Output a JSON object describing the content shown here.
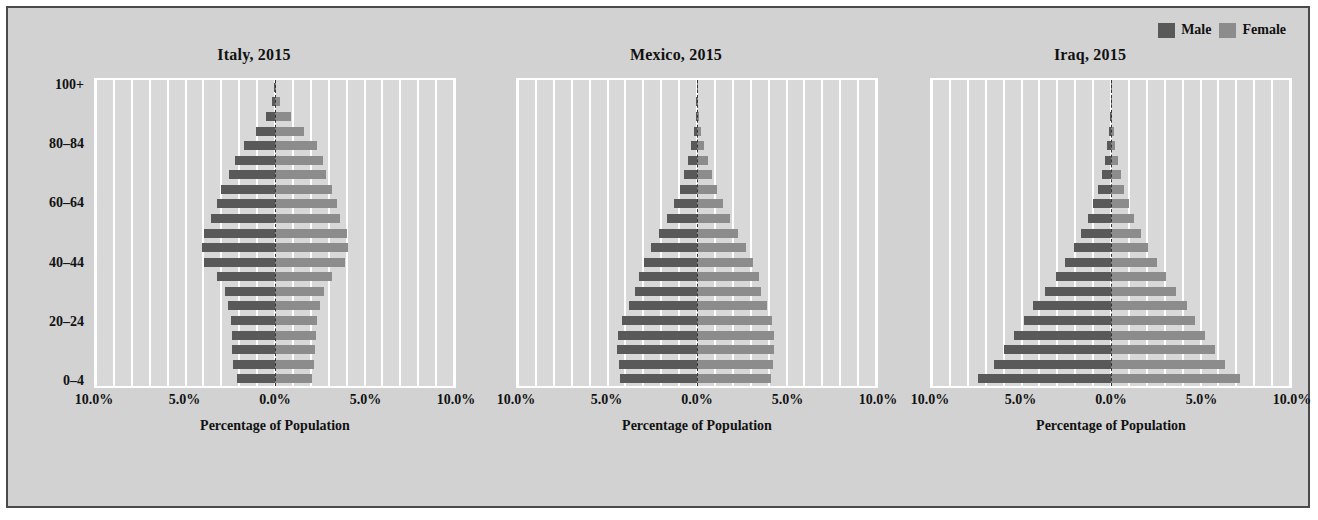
{
  "legend": {
    "items": [
      {
        "label": "Male",
        "color": "#595959"
      },
      {
        "label": "Female",
        "color": "#8c8c8c"
      }
    ]
  },
  "colors": {
    "male": "#595959",
    "female": "#8c8c8c",
    "figure_background": "#d2d2d2",
    "plot_background": "#d8d8d8",
    "gridline": "#ffffff",
    "border": "#4a4a4a",
    "text": "#111111"
  },
  "axis": {
    "xlabel": "Percentage of Population",
    "xticks": [
      "10.0%",
      "5.0%",
      "0.0%",
      "5.0%",
      "10.0%"
    ],
    "xtick_values": [
      -10,
      -5,
      0,
      5,
      10
    ],
    "xlim": [
      -10,
      10
    ],
    "yticks": [
      "100+",
      "80–84",
      "60–64",
      "40–44",
      "20–24",
      "0–4"
    ],
    "ytick_indices": [
      20,
      16,
      12,
      8,
      4,
      0
    ],
    "age_groups": [
      "0–4",
      "5–9",
      "10–14",
      "15–19",
      "20–24",
      "25–29",
      "30–34",
      "35–39",
      "40–44",
      "45–49",
      "50–54",
      "55–59",
      "60–64",
      "65–69",
      "70–74",
      "75–79",
      "80–84",
      "85–89",
      "90–94",
      "95–99",
      "100+"
    ]
  },
  "chart_data": {
    "type": "bar",
    "xlabel": "Percentage of Population",
    "ylabel": "",
    "xlim": [
      -10,
      10
    ],
    "grid": true,
    "legend_position": "top-right",
    "categories": [
      "0–4",
      "5–9",
      "10–14",
      "15–19",
      "20–24",
      "25–29",
      "30–34",
      "35–39",
      "40–44",
      "45–49",
      "50–54",
      "55–59",
      "60–64",
      "65–69",
      "70–74",
      "75–79",
      "80–84",
      "85–89",
      "90–94",
      "95–99",
      "100+"
    ],
    "panels": [
      {
        "title": "Italy, 2015",
        "series": [
          {
            "name": "Male",
            "values": [
              2.15,
              2.35,
              2.4,
              2.4,
              2.45,
              2.6,
              2.8,
              3.25,
              3.95,
              4.1,
              3.95,
              3.55,
              3.25,
              3.0,
              2.55,
              2.25,
              1.75,
              1.05,
              0.5,
              0.15,
              0.03
            ]
          },
          {
            "name": "Female",
            "values": [
              2.05,
              2.2,
              2.25,
              2.3,
              2.35,
              2.5,
              2.75,
              3.2,
              3.9,
              4.1,
              4.0,
              3.65,
              3.45,
              3.2,
              2.85,
              2.7,
              2.35,
              1.6,
              0.9,
              0.3,
              0.07
            ]
          }
        ]
      },
      {
        "title": "Mexico, 2015",
        "series": [
          {
            "name": "Male",
            "values": [
              4.3,
              4.35,
              4.45,
              4.4,
              4.2,
              3.8,
              3.45,
              3.25,
              2.95,
              2.55,
              2.1,
              1.7,
              1.3,
              0.95,
              0.7,
              0.5,
              0.32,
              0.18,
              0.08,
              0.03,
              0.01
            ]
          },
          {
            "name": "Female",
            "values": [
              4.15,
              4.25,
              4.3,
              4.3,
              4.2,
              3.9,
              3.6,
              3.45,
              3.15,
              2.75,
              2.3,
              1.85,
              1.45,
              1.1,
              0.82,
              0.6,
              0.4,
              0.23,
              0.11,
              0.04,
              0.01
            ]
          }
        ]
      },
      {
        "title": "Iraq, 2015",
        "series": [
          {
            "name": "Male",
            "values": [
              7.45,
              6.55,
              6.0,
              5.4,
              4.85,
              4.35,
              3.7,
              3.05,
              2.55,
              2.05,
              1.65,
              1.3,
              1.0,
              0.72,
              0.52,
              0.35,
              0.22,
              0.12,
              0.05,
              0.02,
              0.01
            ]
          },
          {
            "name": "Female",
            "values": [
              7.2,
              6.35,
              5.8,
              5.25,
              4.7,
              4.25,
              3.65,
              3.05,
              2.55,
              2.05,
              1.65,
              1.3,
              1.02,
              0.75,
              0.55,
              0.38,
              0.25,
              0.14,
              0.06,
              0.02,
              0.01
            ]
          }
        ]
      }
    ]
  }
}
